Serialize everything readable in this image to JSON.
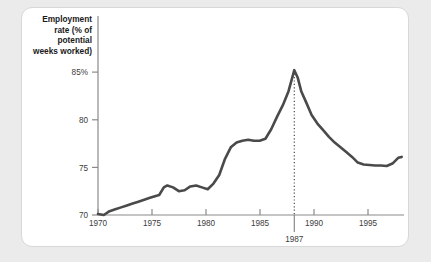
{
  "figure": {
    "background_color": "#ebebeb",
    "card_color": "#ffffff",
    "card_border_color": "#d8d8d8"
  },
  "chart_data": {
    "type": "line",
    "title": "",
    "ylabel": "Employment rate (% of potential weeks worked)",
    "ylabel_lines": [
      "Employment",
      "rate (% of",
      "potential",
      "weeks worked)"
    ],
    "xlabel": "",
    "xlim": [
      1970,
      1996.5
    ],
    "ylim": [
      70,
      86.2
    ],
    "grid": false,
    "legend": null,
    "line_color": "#4a4a4a",
    "axis_color": "#8a8a8a",
    "y_ticks": [
      70,
      75,
      80,
      85
    ],
    "y_tick_labels": [
      "70",
      "75",
      "80",
      "85%"
    ],
    "x_ticks": [
      1970,
      1975,
      1980,
      1985,
      1990,
      1995
    ],
    "x_tick_labels": [
      "1970",
      "1975",
      "1980",
      "1985",
      "1990",
      "1995"
    ],
    "annotations": [
      {
        "label": "1987",
        "x": 1987,
        "y_top": 85.2,
        "y_bottom": 70,
        "style": "dotted-vertical-line",
        "color": "#4a4a4a"
      }
    ],
    "x": [
      1970,
      1970.5,
      1971,
      1971.5,
      1972,
      1972.5,
      1973,
      1973.5,
      1974,
      1974.5,
      1975,
      1975.3,
      1975.7,
      1976,
      1976.5,
      1977,
      1977.5,
      1978,
      1978.5,
      1979,
      1979.5,
      1980,
      1980.5,
      1981,
      1981.5,
      1982,
      1982.5,
      1983,
      1983.5,
      1984,
      1984.5,
      1985,
      1985.5,
      1986,
      1986.5,
      1987,
      1987.3,
      1987.6,
      1988,
      1988.5,
      1989,
      1989.5,
      1990,
      1990.5,
      1991,
      1991.5,
      1992,
      1992.5,
      1993,
      1993.5,
      1994,
      1994.5,
      1995,
      1995.5,
      1996,
      1996.3
    ],
    "y": [
      70.1,
      70.0,
      70.4,
      70.6,
      70.8,
      71.0,
      71.2,
      71.4,
      71.6,
      71.8,
      72.0,
      72.1,
      72.9,
      73.1,
      72.9,
      72.5,
      72.6,
      73.0,
      73.1,
      72.9,
      72.7,
      73.3,
      74.2,
      75.9,
      77.1,
      77.6,
      77.8,
      77.9,
      77.8,
      77.8,
      78.0,
      79.0,
      80.3,
      81.5,
      83.0,
      85.2,
      84.4,
      83.0,
      81.9,
      80.5,
      79.6,
      78.9,
      78.2,
      77.6,
      77.1,
      76.6,
      76.1,
      75.5,
      75.3,
      75.25,
      75.2,
      75.2,
      75.15,
      75.4,
      76.0,
      76.1
    ],
    "peak": {
      "year": 1987,
      "value": 85.2
    },
    "start": {
      "year": 1970,
      "value": 70.1
    },
    "end": {
      "year": 1996,
      "value": 76.1
    }
  }
}
